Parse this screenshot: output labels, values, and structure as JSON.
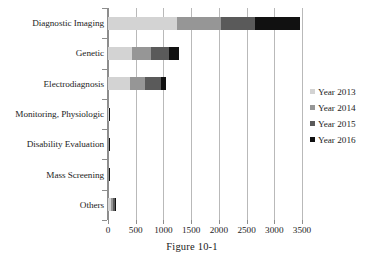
{
  "caption": "Figure 10-1",
  "chart_data": {
    "type": "bar",
    "orientation": "horizontal",
    "stacked": true,
    "title": "",
    "xlabel": "",
    "ylabel": "",
    "xlim": [
      0,
      3500
    ],
    "xticks": [
      0,
      500,
      1000,
      1500,
      2000,
      2500,
      3000,
      3500
    ],
    "xtick_labels": [
      "0",
      "500",
      "1000",
      "1500",
      "2000",
      "2500",
      "3000",
      "3500"
    ],
    "grid": true,
    "grid_axis": "x",
    "legend_position": "right",
    "categories": [
      "Diagnostic Imaging",
      "Genetic",
      "Electrodiagnosis",
      "Monitoring, Physiologic",
      "Disability Evaluation",
      "Mass Screening",
      "Others"
    ],
    "series": [
      {
        "name": "Year 2013",
        "color": "#d3d3d3",
        "values": [
          1240,
          440,
          400,
          10,
          8,
          8,
          55
        ]
      },
      {
        "name": "Year 2014",
        "color": "#969696",
        "values": [
          800,
          340,
          265,
          8,
          7,
          6,
          35
        ]
      },
      {
        "name": "Year 2015",
        "color": "#5a5a5a",
        "values": [
          620,
          320,
          290,
          8,
          7,
          6,
          30
        ]
      },
      {
        "name": "Year 2016",
        "color": "#111111",
        "values": [
          800,
          180,
          100,
          8,
          6,
          5,
          25
        ]
      }
    ],
    "totals": [
      3460,
      1280,
      1055,
      34,
      28,
      25,
      145
    ]
  },
  "legend": {
    "items": [
      {
        "label": "Year 2013",
        "color": "#d3d3d3"
      },
      {
        "label": "Year 2014",
        "color": "#969696"
      },
      {
        "label": "Year 2015",
        "color": "#5a5a5a"
      },
      {
        "label": "Year 2016",
        "color": "#111111"
      }
    ]
  }
}
